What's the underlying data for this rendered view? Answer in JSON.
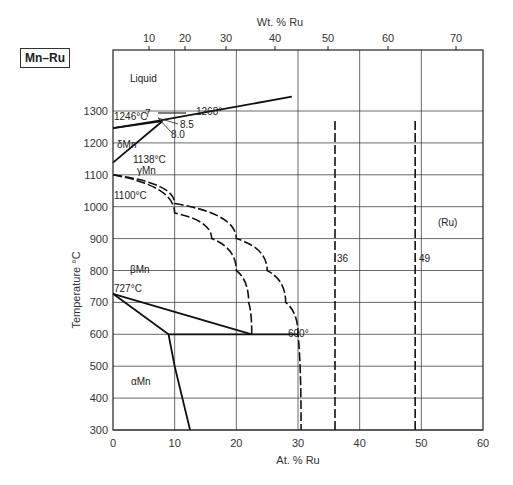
{
  "chart_data": {
    "type": "line",
    "title": "Mn–Ru",
    "xlabel": "At. % Ru",
    "x2label": "Wt. % Ru",
    "ylabel": "Temperature °C",
    "xlim": [
      0,
      60
    ],
    "ylim": [
      300,
      1400
    ],
    "x_ticks": [
      0,
      10,
      20,
      30,
      40,
      50,
      60
    ],
    "x2_ticks": [
      10,
      20,
      30,
      40,
      50,
      60,
      70
    ],
    "y_ticks": [
      300,
      400,
      500,
      600,
      700,
      800,
      900,
      1000,
      1100,
      1200,
      1300
    ],
    "grid": true,
    "phase_labels": [
      "Liquid",
      "δMn",
      "γMn",
      "βMn",
      "αMn",
      "(Ru)"
    ],
    "annotations": [
      "1246°C",
      "7",
      "1268°",
      "8.5",
      "8.0",
      "1138°C",
      "1100°C",
      "727°C",
      "600°",
      "36",
      "49"
    ],
    "series": [
      {
        "name": "liquidus",
        "style": "solid",
        "x": [
          0,
          7,
          29
        ],
        "y": [
          1246,
          1268,
          1345
        ]
      },
      {
        "name": "delta-solvus",
        "style": "solid",
        "x": [
          0,
          8
        ],
        "y": [
          1246,
          1268
        ]
      },
      {
        "name": "gamma-delta",
        "style": "solid",
        "x": [
          0,
          8
        ],
        "y": [
          1138,
          1268
        ]
      },
      {
        "name": "gamma-beta-upper",
        "style": "dashed",
        "x": [
          0,
          10,
          20,
          25,
          28,
          30,
          30.5
        ],
        "y": [
          1100,
          1010,
          900,
          800,
          700,
          600,
          300
        ]
      },
      {
        "name": "gamma-beta-lower",
        "style": "dashed",
        "x": [
          0,
          10,
          16,
          20,
          22,
          22.5
        ],
        "y": [
          1100,
          980,
          900,
          800,
          700,
          600
        ]
      },
      {
        "name": "beta-alpha",
        "style": "solid",
        "x": [
          0,
          22.5
        ],
        "y": [
          727,
          600
        ]
      },
      {
        "name": "alpha-solvus",
        "style": "solid",
        "x": [
          0,
          9,
          10,
          12.5
        ],
        "y": [
          727,
          600,
          500,
          300
        ]
      },
      {
        "name": "eutectoid-600",
        "style": "solid",
        "x": [
          9,
          30
        ],
        "y": [
          600,
          600
        ]
      },
      {
        "name": "line-36",
        "style": "dashed",
        "x": [
          36,
          36
        ],
        "y": [
          300,
          1270
        ]
      },
      {
        "name": "line-49",
        "style": "dashed",
        "x": [
          49,
          49
        ],
        "y": [
          300,
          1270
        ]
      }
    ]
  },
  "header": {
    "system_label": "Mn–Ru"
  }
}
